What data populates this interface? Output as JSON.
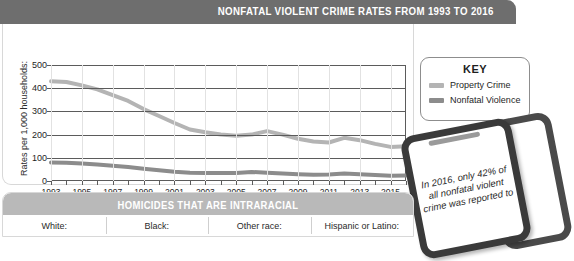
{
  "header": {
    "title": "NONFATAL VIOLENT CRIME RATES FROM 1993 TO 2016"
  },
  "key": {
    "title": "KEY",
    "items": [
      {
        "label": "Property Crime",
        "color": "#b4b4b4"
      },
      {
        "label": "Nonfatal Violence",
        "color": "#8c8c8c"
      }
    ]
  },
  "callout": {
    "text": "In 2016, only 42% of all nonfatal violent crime was reported to"
  },
  "table": {
    "title": "HOMICIDES THAT ARE INTRARACIAL",
    "columns": [
      "White:",
      "Black:",
      "Other race:",
      "Hispanic or Latino:"
    ]
  },
  "chart_data": {
    "type": "line",
    "title": "NONFATAL VIOLENT CRIME RATES FROM 1993 TO 2016",
    "xlabel": "",
    "ylabel": "Rates per 1,000 households:",
    "ylim": [
      0,
      500
    ],
    "ytick_values": [
      0,
      100,
      200,
      300,
      400,
      500
    ],
    "grid": "horizontal-and-vertical",
    "legend_position": "right",
    "x": [
      1993,
      1994,
      1995,
      1996,
      1997,
      1998,
      1999,
      2000,
      2001,
      2002,
      2003,
      2004,
      2005,
      2006,
      2007,
      2008,
      2009,
      2010,
      2011,
      2012,
      2013,
      2014,
      2015,
      2016
    ],
    "xtick_labels": [
      "1993",
      "1995",
      "1997",
      "1999",
      "2001",
      "2003",
      "2005",
      "2007",
      "2009",
      "2011",
      "2013",
      "2015"
    ],
    "series": [
      {
        "name": "Property Crime",
        "color": "#b4b4b4",
        "values": [
          430,
          427,
          412,
          395,
          370,
          345,
          310,
          280,
          250,
          222,
          210,
          200,
          195,
          200,
          215,
          200,
          182,
          170,
          166,
          186,
          176,
          160,
          147,
          150
        ]
      },
      {
        "name": "Nonfatal Violence",
        "color": "#8c8c8c",
        "values": [
          80,
          79,
          75,
          71,
          66,
          60,
          53,
          46,
          40,
          36,
          35,
          34,
          34,
          39,
          36,
          32,
          29,
          27,
          28,
          32,
          29,
          26,
          23,
          24
        ]
      }
    ]
  }
}
